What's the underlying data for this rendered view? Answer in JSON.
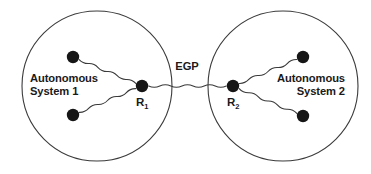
{
  "diagram": {
    "background_color": "#ffffff",
    "stroke_color": "#3a3a3a",
    "node_color": "#161616",
    "text_color": "#1a1a1a",
    "regions": [
      {
        "id": "as1",
        "label_line1": "Autonomous",
        "label_line2": "System 1",
        "label_anchor": "start",
        "label_x": 30,
        "label_y": 82,
        "circle": {
          "cx": 97,
          "cy": 86,
          "r": 75
        }
      },
      {
        "id": "as2",
        "label_line1": "Autonomous",
        "label_line2": "System 2",
        "label_anchor": "end",
        "label_x": 345,
        "label_y": 82,
        "circle": {
          "cx": 283,
          "cy": 86,
          "r": 75
        }
      }
    ],
    "routers": [
      {
        "id": "r1",
        "label": "R",
        "subscript": "1",
        "cx": 142,
        "cy": 86,
        "r": 6.2,
        "label_x": 136,
        "label_y": 106
      },
      {
        "id": "r2",
        "label": "R",
        "subscript": "2",
        "cx": 233,
        "cy": 86,
        "r": 6.2,
        "label_x": 227,
        "label_y": 106
      }
    ],
    "hosts": [
      {
        "id": "as1-host-top",
        "cx": 73,
        "cy": 57,
        "r": 6.2
      },
      {
        "id": "as1-host-bottom",
        "cx": 73,
        "cy": 115,
        "r": 6.2
      },
      {
        "id": "as2-host-top",
        "cx": 303,
        "cy": 57,
        "r": 6.2
      },
      {
        "id": "as2-host-bottom",
        "cx": 303,
        "cy": 116,
        "r": 6.2
      }
    ],
    "links": [
      {
        "id": "link-as1-top",
        "type": "wavy",
        "from": "as1-host-top",
        "to": "r1"
      },
      {
        "id": "link-as1-bottom",
        "type": "wavy",
        "from": "as1-host-bottom",
        "to": "r1"
      },
      {
        "id": "link-as2-top",
        "type": "wavy",
        "from": "r2",
        "to": "as2-host-top"
      },
      {
        "id": "link-as2-bottom",
        "type": "wavy",
        "from": "r2",
        "to": "as2-host-bottom"
      },
      {
        "id": "link-egp",
        "type": "wavy",
        "from": "r1",
        "to": "r2",
        "label": "EGP"
      }
    ],
    "protocol_label": {
      "text": "EGP",
      "x": 187,
      "y": 70
    }
  }
}
